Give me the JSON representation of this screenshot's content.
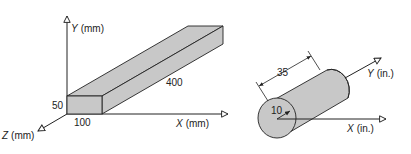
{
  "figure_a": {
    "title": "Rectangular bar in mm",
    "axes": {
      "y_axis": {
        "letter": "Y",
        "unit": "(mm)"
      },
      "x_axis": {
        "letter": "X",
        "unit": "(mm)"
      },
      "z_axis": {
        "letter": "Z",
        "unit": "(mm)"
      }
    },
    "dimensions": {
      "height": "50",
      "width": "100",
      "length": "400"
    }
  },
  "figure_b": {
    "title": "Cylinder in inches",
    "axes": {
      "y_axis": {
        "letter": "Y",
        "unit": "(in.)"
      },
      "x_axis": {
        "letter": "X",
        "unit": "(in.)"
      }
    },
    "dimensions": {
      "length": "35",
      "radius": "10"
    }
  },
  "colors": {
    "fill": "#c8c8c8",
    "stroke": "#222222"
  }
}
